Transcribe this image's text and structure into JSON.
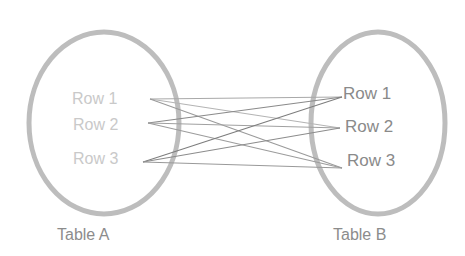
{
  "diagram": {
    "type": "cross-join",
    "colors": {
      "ellipse_stroke": "#bdbdbd",
      "line": "#8e8e8e",
      "left_row_text": "#c9c9c9",
      "right_row_text": "#8a8a8a",
      "table_label": "#8c8c8c"
    },
    "table_a": {
      "label": "Table A",
      "rows": [
        "Row 1",
        "Row 2",
        "Row 3"
      ]
    },
    "table_b": {
      "label": "Table B",
      "rows": [
        "Row 1",
        "Row 2",
        "Row 3"
      ]
    },
    "connections": [
      {
        "from": "Row 1",
        "to": "Row 1"
      },
      {
        "from": "Row 1",
        "to": "Row 2"
      },
      {
        "from": "Row 1",
        "to": "Row 3"
      },
      {
        "from": "Row 2",
        "to": "Row 1"
      },
      {
        "from": "Row 2",
        "to": "Row 2"
      },
      {
        "from": "Row 2",
        "to": "Row 3"
      },
      {
        "from": "Row 3",
        "to": "Row 1"
      },
      {
        "from": "Row 3",
        "to": "Row 2"
      },
      {
        "from": "Row 3",
        "to": "Row 3"
      }
    ]
  }
}
